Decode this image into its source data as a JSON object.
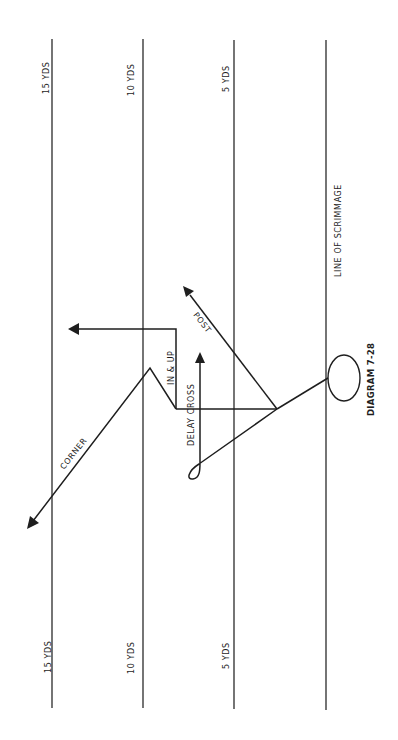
{
  "diagram": {
    "title": "DIAGRAM 7-28",
    "line_of_scrimmage_label": "LINE OF SCRIMMAGE",
    "yard_lines": [
      {
        "label_top": "15 YDS",
        "label_bottom": "15 YDS"
      },
      {
        "label_top": "10 YDS",
        "label_bottom": "10 YDS"
      },
      {
        "label_top": "5 YDS",
        "label_bottom": "5 YDS"
      },
      {
        "label_top": "",
        "label_bottom": ""
      }
    ],
    "routes": {
      "corner": "CORNER",
      "in_and_up": "IN & UP",
      "delay_cross": "DELAY CROSS",
      "post": "POST"
    },
    "player": "receiver-circle"
  }
}
